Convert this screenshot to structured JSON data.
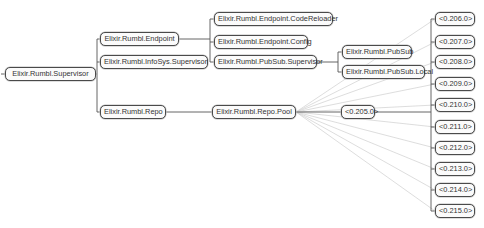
{
  "diagram": {
    "type": "supervision-tree",
    "colors": {
      "edge": "#555555",
      "fan_edge": "#d4d4d4",
      "node_border": "#4a4a4a",
      "node_fill": "#fbfbfb",
      "text": "#333333"
    },
    "nodes": {
      "supervisor": "Elixir.Rumbl.Supervisor",
      "endpoint": "Elixir.Rumbl.Endpoint",
      "infosys": "Elixir.Rumbl.InfoSys.Supervisor",
      "repo": "Elixir.Rumbl.Repo",
      "code_reloader": "Elixir.Rumbl.Endpoint.CodeReloader",
      "endpoint_config": "Elixir.Rumbl.Endpoint.Config",
      "pubsub_supervisor": "Elixir.Rumbl.PubSub.Supervisor",
      "repo_pool": "Elixir.Rumbl.Repo.Pool",
      "pubsub": "Elixir.Rumbl.PubSub",
      "pubsub_local": "Elixir.Rumbl.PubSub.Local",
      "pid_205": "<0.205.0>",
      "pid_206": "<0.206.0>",
      "pid_207": "<0.207.0>",
      "pid_208": "<0.208.0>",
      "pid_209": "<0.209.0>",
      "pid_210": "<0.210.0>",
      "pid_211": "<0.211.0>",
      "pid_212": "<0.212.0>",
      "pid_213": "<0.213.0>",
      "pid_214": "<0.214.0>",
      "pid_215": "<0.215.0>"
    },
    "edges": [
      [
        "supervisor",
        "endpoint"
      ],
      [
        "supervisor",
        "infosys"
      ],
      [
        "supervisor",
        "repo"
      ],
      [
        "endpoint",
        "code_reloader"
      ],
      [
        "endpoint",
        "endpoint_config"
      ],
      [
        "endpoint",
        "pubsub_supervisor"
      ],
      [
        "pubsub_supervisor",
        "pubsub"
      ],
      [
        "pubsub_supervisor",
        "pubsub_local"
      ],
      [
        "repo",
        "repo_pool"
      ],
      [
        "repo_pool",
        "pid_205"
      ],
      [
        "pid_205",
        "pid_206"
      ],
      [
        "pid_205",
        "pid_207"
      ],
      [
        "pid_205",
        "pid_208"
      ],
      [
        "pid_205",
        "pid_209"
      ],
      [
        "pid_205",
        "pid_210"
      ],
      [
        "pid_205",
        "pid_211"
      ],
      [
        "pid_205",
        "pid_212"
      ],
      [
        "pid_205",
        "pid_213"
      ],
      [
        "pid_205",
        "pid_214"
      ],
      [
        "pid_205",
        "pid_215"
      ]
    ],
    "link_edges": [
      [
        "repo_pool",
        "pid_206"
      ],
      [
        "repo_pool",
        "pid_207"
      ],
      [
        "repo_pool",
        "pid_208"
      ],
      [
        "repo_pool",
        "pid_209"
      ],
      [
        "repo_pool",
        "pid_210"
      ],
      [
        "repo_pool",
        "pid_211"
      ],
      [
        "repo_pool",
        "pid_212"
      ],
      [
        "repo_pool",
        "pid_213"
      ],
      [
        "repo_pool",
        "pid_214"
      ],
      [
        "repo_pool",
        "pid_215"
      ]
    ]
  }
}
